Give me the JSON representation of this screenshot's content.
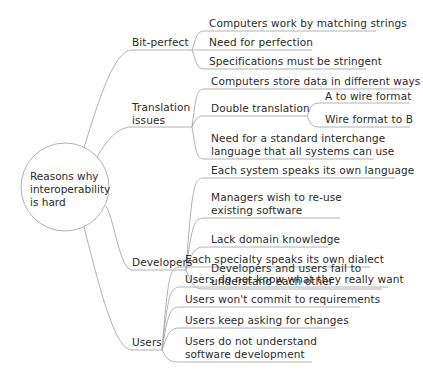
{
  "root": {
    "lines": [
      "Reasons why",
      "interoperability",
      "is hard"
    ]
  },
  "branches": [
    {
      "label": "Bit-perfect",
      "children": [
        {
          "label": "Computers work by matching strings"
        },
        {
          "label": "Need for perfection"
        },
        {
          "label": "Specifications must be stringent"
        }
      ]
    },
    {
      "label_lines": [
        "Translation",
        "issues"
      ],
      "children": [
        {
          "label": "Computers store data in different ways"
        },
        {
          "label": "Double translation",
          "children": [
            {
              "label": "A to wire format"
            },
            {
              "label": "Wire format to B"
            }
          ]
        },
        {
          "label_lines": [
            "Need for a standard interchange",
            "language that all systems can use"
          ]
        }
      ]
    },
    {
      "label": "Developers",
      "children": [
        {
          "label": "Each system speaks its own language"
        },
        {
          "label_lines": [
            "Managers wish to re-use",
            "existing software"
          ]
        },
        {
          "label": "Lack domain knowledge"
        },
        {
          "label_lines": [
            "Developers and users fail to",
            "understand each other"
          ]
        }
      ]
    },
    {
      "label": "Users",
      "children": [
        {
          "label": "Each specialty speaks its own dialect"
        },
        {
          "label": "Users do not know what they really want"
        },
        {
          "label": "Users won't commit to requirements"
        },
        {
          "label": "Users keep asking for changes"
        },
        {
          "label_lines": [
            "Users do not understand",
            "software development"
          ]
        }
      ]
    }
  ],
  "colors": {
    "line": "#a8a8a8",
    "text": "#2b2b2b",
    "background": "#ffffff"
  }
}
